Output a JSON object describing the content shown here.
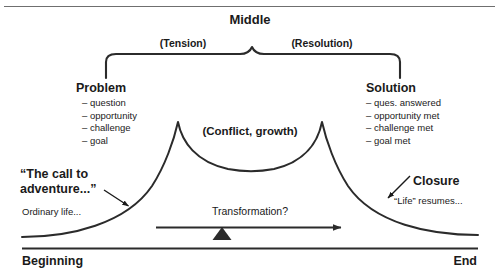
{
  "diagram": {
    "title_top": "Middle",
    "phases": {
      "tension": "(Tension)",
      "resolution": "(Resolution)"
    },
    "left_block": {
      "heading": "Problem",
      "items": [
        "– question",
        "– opportunity",
        "– challenge",
        "– goal"
      ]
    },
    "right_block": {
      "heading": "Solution",
      "items": [
        "– ques. answered",
        "– opportunity met",
        "– challenge met",
        "– goal met"
      ]
    },
    "center_label": "(Conflict, growth)",
    "call_to_adventure": "“The call to\nadventure...”",
    "closure": "Closure",
    "ordinary_life": "Ordinary life...",
    "life_resumes": "“Life” resumes...",
    "transformation": "Transformation?",
    "beginning": "Beginning",
    "end": "End",
    "colors": {
      "ink": "#1a1a1a",
      "line": "#2b2b2b",
      "background": "#ffffff"
    },
    "icons": {
      "brace": "curly-brace",
      "arrow": "right-arrow",
      "fulcrum": "triangle-fulcrum",
      "pointer_left": "arrow-pointer",
      "pointer_right": "arrow-pointer"
    }
  }
}
